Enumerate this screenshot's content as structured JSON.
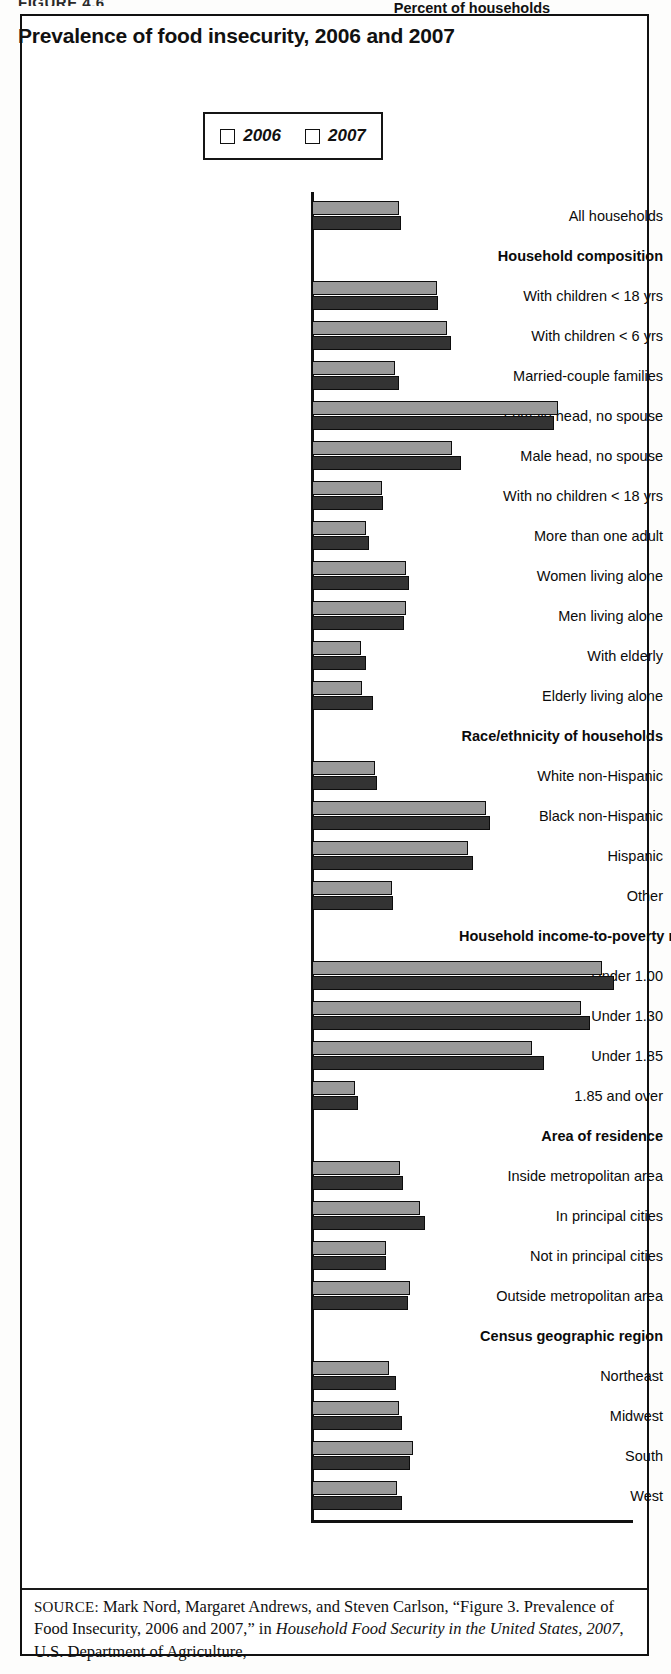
{
  "figure": {
    "label": "FIGURE 4.6",
    "title": "Prevalence of food insecurity, 2006 and 2007"
  },
  "legend": {
    "position": "top-center",
    "entries": [
      {
        "label": "2006",
        "color": "#999999"
      },
      {
        "label": "2007",
        "color": "#333333"
      }
    ]
  },
  "axis": {
    "x_title": "Percent of households",
    "x_ticks": [
      "0",
      "5",
      "10",
      "15",
      "20",
      "25",
      "30",
      "35",
      "40"
    ],
    "x_min": 0,
    "x_max": 40
  },
  "source": {
    "prefix": "SOURCE:",
    "line1_a": " Mark Nord, Margaret Andrews, and Steven Carlson, “Figure 3.",
    "line2_a": "Prevalence of Food Insecurity, 2006 and 2007,” in ",
    "line2_i": "Household Food",
    "line3_i": "Security in the United States, 2007",
    "line3_a": ", U.S. Department of Agriculture,"
  },
  "chart_data": {
    "type": "bar",
    "orientation": "horizontal",
    "title": "Prevalence of food insecurity, 2006 and 2007",
    "xlabel": "Percent of households",
    "ylabel": "",
    "xlim": [
      0,
      40
    ],
    "grid": false,
    "legend_position": "top-center",
    "categories": [
      "All households",
      "Household composition",
      "With children < 18 yrs",
      "With children < 6 yrs",
      "Married-couple families",
      "Female head, no spouse",
      "Male head, no spouse",
      "With no children < 18 yrs",
      "More than one adult",
      "Women living alone",
      "Men living alone",
      "With elderly",
      "Elderly living alone",
      "Race/ethnicity of households",
      "White non-Hispanic",
      "Black non-Hispanic",
      "Hispanic",
      "Other",
      "Household income-to-poverty ratio",
      "Under 1.00",
      "Under 1.30",
      "Under 1.85",
      "1.85 and over",
      "Area of residence",
      "Inside metropolitan area",
      "In principal cities",
      "Not in principal cities",
      "Outside metropolitan area",
      "Census geographic region",
      "Northeast",
      "Midwest",
      "South",
      "West"
    ],
    "group_headings": [
      "Household composition",
      "Race/ethnicity of households",
      "Household income-to-poverty ratio",
      "Area of residence",
      "Census geographic region"
    ],
    "series": [
      {
        "name": "2006",
        "color": "#999999",
        "values": [
          10.9,
          null,
          15.6,
          16.9,
          10.4,
          30.7,
          17.5,
          8.7,
          6.8,
          11.7,
          11.7,
          6.1,
          6.2,
          null,
          7.9,
          21.8,
          19.5,
          10.0,
          null,
          36.3,
          33.6,
          27.5,
          5.4,
          null,
          11.0,
          13.5,
          9.2,
          12.3,
          null,
          9.6,
          10.9,
          12.6,
          10.6
        ]
      },
      {
        "name": "2007",
        "color": "#333333",
        "values": [
          11.1,
          null,
          15.8,
          17.4,
          10.9,
          30.2,
          18.6,
          8.9,
          7.1,
          12.1,
          11.5,
          6.7,
          7.6,
          null,
          8.1,
          22.2,
          20.1,
          10.1,
          null,
          37.7,
          34.8,
          29.0,
          5.7,
          null,
          11.4,
          14.1,
          9.3,
          12.0,
          null,
          10.5,
          11.2,
          12.2,
          11.2
        ]
      }
    ]
  }
}
